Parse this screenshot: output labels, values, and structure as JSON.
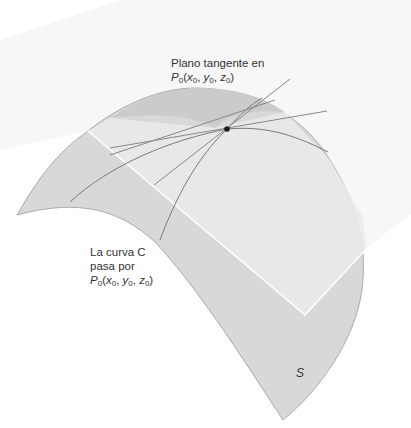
{
  "figure": {
    "type": "surface-tangent-plane-diagram",
    "colors": {
      "background": "#ffffff",
      "plane_fill": "#f2f2f2",
      "surface_fill": "#d9d9d9",
      "surface_light": "#e6e6e6",
      "surface_top_dark": "#cfcfcf",
      "curve_stroke": "#777777",
      "tangent_stroke": "#888888",
      "edge_highlight": "#ffffff",
      "point_fill": "#1a1a1a"
    },
    "point": {
      "name": "P0",
      "x": 227,
      "y": 129
    }
  },
  "labels": {
    "tangent_plane": {
      "line1": "Plano tangente en",
      "point_symbol": "P",
      "point_sub": "0",
      "open": "(",
      "x": "x",
      "x_sub": "0",
      "y": "y",
      "y_sub": "0",
      "z": "z",
      "z_sub": "0",
      "close": ")",
      "sep": ", "
    },
    "curve": {
      "line1": "La curva C",
      "line2": "pasa por",
      "point_symbol": "P",
      "point_sub": "0",
      "open": "(",
      "x": "x",
      "x_sub": "0",
      "y": "y",
      "y_sub": "0",
      "z": "z",
      "z_sub": "0",
      "close": ")",
      "sep": ", "
    },
    "surface": "S"
  }
}
